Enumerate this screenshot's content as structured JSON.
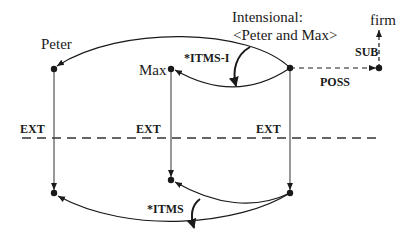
{
  "diagram": {
    "type": "semantic-network",
    "nodes": {
      "peter": {
        "label": "Peter"
      },
      "max": {
        "label": "Max"
      },
      "intensional": {
        "label_line1": "Intensional:",
        "label_line2": "<Peter and Max>"
      },
      "firm": {
        "label": "firm"
      }
    },
    "edges": {
      "itms_i": "*ITMS-I",
      "itms": "*ITMS",
      "poss": "POSS",
      "sub": "SUB",
      "ext_peter": "EXT",
      "ext_max": "EXT",
      "ext_intensional": "EXT"
    },
    "colors": {
      "line": "#1a1a1a",
      "background": "#ffffff"
    }
  }
}
